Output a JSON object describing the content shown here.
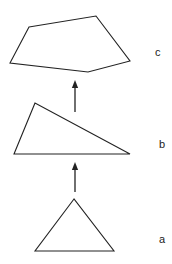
{
  "diagram": {
    "stroke": "#222222",
    "shapes": [
      {
        "id": "c",
        "label": "c",
        "type": "pentagon",
        "points": "29,27 96,16 130,61 88,72 10,63",
        "label_pos": [
          155,
          56
        ]
      },
      {
        "id": "b",
        "label": "b",
        "type": "triangle",
        "points": "35,103 14,154 130,154",
        "label_pos": [
          159,
          148
        ]
      },
      {
        "id": "a",
        "label": "a",
        "type": "triangle",
        "points": "74,199 35,251 114,251",
        "label_pos": [
          159,
          243
        ]
      }
    ],
    "arrows": [
      {
        "from": "b",
        "to": "c",
        "x": 75,
        "y1": 112,
        "y2": 82
      },
      {
        "from": "a",
        "to": "b",
        "x": 75,
        "y1": 192,
        "y2": 164
      }
    ]
  }
}
